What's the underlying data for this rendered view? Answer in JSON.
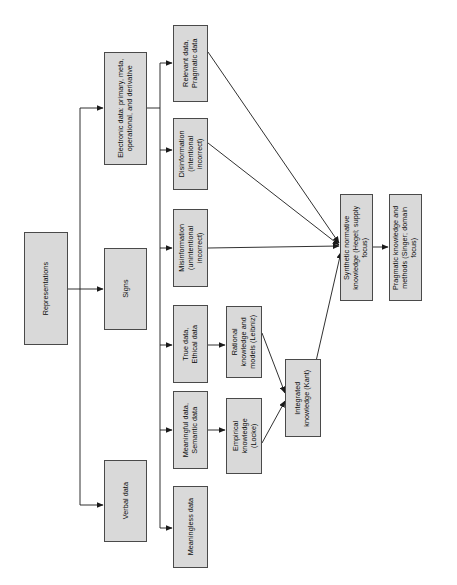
{
  "diagram": {
    "orientation": "rotated-90-ccw",
    "style": {
      "node_fill": "#d9d9d9",
      "node_border": "#4a4a4a",
      "edge_color": "#1a1a1a",
      "background": "#ffffff",
      "text_color": "#0a0a0a"
    },
    "nodes": [
      {
        "id": "representations",
        "label": "Representations"
      },
      {
        "id": "electronic_data",
        "label": "Electronic data: primary, meta,\noperational, and derivative"
      },
      {
        "id": "signs",
        "label": "Signs"
      },
      {
        "id": "verbal_data",
        "label": "Verbal data"
      },
      {
        "id": "relevant_data",
        "label": "Relevant data,\nPragmatic data"
      },
      {
        "id": "disinformation",
        "label": "Disinformation\n(intentional\nincorrect)"
      },
      {
        "id": "misinformation",
        "label": "Misinformation\n(unintentional\nincorrect)"
      },
      {
        "id": "true_data",
        "label": "True data,\nEthical data"
      },
      {
        "id": "meaningful_data",
        "label": "Meaningful data,\nSemantic data"
      },
      {
        "id": "meaningless_data",
        "label": "Meaningless data"
      },
      {
        "id": "rational_knowledge",
        "label": "Rational\nknowledge and\nmodels (Leibniz)"
      },
      {
        "id": "empirical_knowledge",
        "label": "Empirical\nknowledge\n(Locke)"
      },
      {
        "id": "integrated_knowledge",
        "label": "Integrated\nknowledge (Kant)"
      },
      {
        "id": "synthetic_normative_knowledge",
        "label": "Synthetic normative\nknowledge (Hegel; supply\nfocus)"
      },
      {
        "id": "pragmatic_knowledge",
        "label": "Pragmatic knowledge and\nmethods (Singer; domain\nfocus)"
      }
    ],
    "edges": [
      {
        "from": "representations",
        "to": "electronic_data"
      },
      {
        "from": "representations",
        "to": "signs"
      },
      {
        "from": "representations",
        "to": "verbal_data"
      },
      {
        "from": "electronic_data",
        "to": "relevant_data"
      },
      {
        "from": "electronic_data",
        "to": "disinformation"
      },
      {
        "from": "electronic_data",
        "to": "misinformation"
      },
      {
        "from": "electronic_data",
        "to": "true_data"
      },
      {
        "from": "electronic_data",
        "to": "meaningful_data"
      },
      {
        "from": "electronic_data",
        "to": "meaningless_data"
      },
      {
        "from": "true_data",
        "to": "rational_knowledge"
      },
      {
        "from": "meaningful_data",
        "to": "empirical_knowledge"
      },
      {
        "from": "rational_knowledge",
        "to": "integrated_knowledge"
      },
      {
        "from": "empirical_knowledge",
        "to": "integrated_knowledge"
      },
      {
        "from": "relevant_data",
        "to": "synthetic_normative_knowledge"
      },
      {
        "from": "disinformation",
        "to": "synthetic_normative_knowledge"
      },
      {
        "from": "misinformation",
        "to": "synthetic_normative_knowledge"
      },
      {
        "from": "integrated_knowledge",
        "to": "synthetic_normative_knowledge"
      },
      {
        "from": "synthetic_normative_knowledge",
        "to": "pragmatic_knowledge"
      }
    ]
  }
}
